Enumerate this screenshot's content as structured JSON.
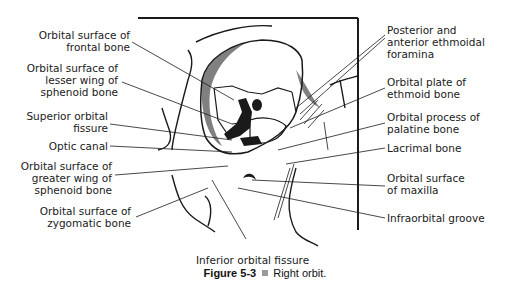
{
  "figure": {
    "number": "Figure 5-3",
    "bullet_color": "#9a9a9a",
    "title": "Right orbit."
  },
  "labels_left": [
    {
      "lines": [
        "Orbital surface of",
        "frontal bone"
      ]
    },
    {
      "lines": [
        "Orbital surface of",
        "lesser wing of",
        "sphenoid bone"
      ]
    },
    {
      "lines": [
        "Superior orbital",
        "fissure"
      ]
    },
    {
      "lines": [
        "Optic canal"
      ]
    },
    {
      "lines": [
        "Orbital surface of",
        "greater wing of",
        "sphenoid bone"
      ]
    },
    {
      "lines": [
        "Orbital surface of",
        "zygomatic bone"
      ]
    }
  ],
  "labels_right": [
    {
      "lines": [
        "Posterior and",
        "anterior ethmoidal",
        "foramina"
      ]
    },
    {
      "lines": [
        "Orbital plate of",
        "ethmoid bone"
      ]
    },
    {
      "lines": [
        "Orbital process of",
        "palatine bone"
      ]
    },
    {
      "lines": [
        "Lacrimal bone"
      ]
    },
    {
      "lines": [
        "Orbital surface",
        "of maxilla"
      ]
    },
    {
      "lines": [
        "Infraorbital groove"
      ]
    }
  ],
  "labels_bottom": [
    {
      "lines": [
        "Inferior orbital fissure"
      ]
    }
  ],
  "colors": {
    "ink": "#1a1a1a",
    "background": "#ffffff"
  }
}
